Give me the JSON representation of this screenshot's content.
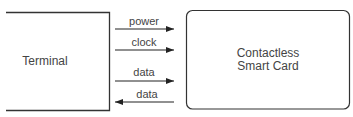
{
  "diagram": {
    "terminal": {
      "label": "Terminal"
    },
    "card": {
      "label_line1": "Contactless",
      "label_line2": "Smart Card"
    },
    "signals": [
      {
        "label": "power",
        "direction": "right"
      },
      {
        "label": "clock",
        "direction": "right"
      },
      {
        "label": "data",
        "direction": "right"
      },
      {
        "label": "data",
        "direction": "left"
      }
    ],
    "colors": {
      "stroke": "#333333",
      "text": "#444444"
    }
  }
}
